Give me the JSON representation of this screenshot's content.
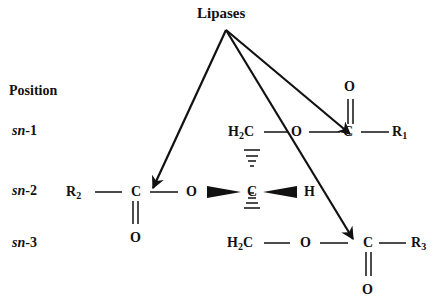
{
  "title": "Lipases",
  "position_header": "Position",
  "positions": [
    {
      "prefix": "sn",
      "suffix": "-1"
    },
    {
      "prefix": "sn",
      "suffix": "-2"
    },
    {
      "prefix": "sn",
      "suffix": "-3"
    }
  ],
  "atoms": {
    "sn1": {
      "ch2": "H",
      "ch2_sub": "2",
      "ch2_c": "C",
      "o_ester": "O",
      "carbonyl_c": "C",
      "carbonyl_o": "O",
      "r": "R",
      "r_sub": "1"
    },
    "sn2": {
      "r": "R",
      "r_sub": "2",
      "carbonyl_c": "C",
      "carbonyl_o": "O",
      "o_ester": "O",
      "center_c": "C",
      "h": "H"
    },
    "sn3": {
      "ch2": "H",
      "ch2_sub": "2",
      "ch2_c": "C",
      "o_ester": "O",
      "carbonyl_c": "C",
      "carbonyl_o": "O",
      "r": "R",
      "r_sub": "3"
    }
  },
  "colors": {
    "ink": "#111111",
    "background": "#ffffff"
  }
}
